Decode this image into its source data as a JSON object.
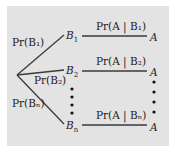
{
  "diagram": {
    "type": "probability-tree",
    "colors": {
      "background": "#e3e3e3",
      "line": "#3a3a3a",
      "text": "#222222"
    },
    "branches": [
      {
        "prior_label": "Pr(B₁)",
        "node": "B",
        "node_sub": "1",
        "conditional_label": "Pr(A | B₁)",
        "outcome": "A"
      },
      {
        "prior_label": "Pr(B₂)",
        "node": "B",
        "node_sub": "2",
        "conditional_label": "Pr(A | B₂)",
        "outcome": "A"
      },
      {
        "prior_label": "Pr(Bₙ)",
        "node": "B",
        "node_sub": "n",
        "conditional_label": "Pr(A | Bₙ)",
        "outcome": "A"
      }
    ]
  }
}
